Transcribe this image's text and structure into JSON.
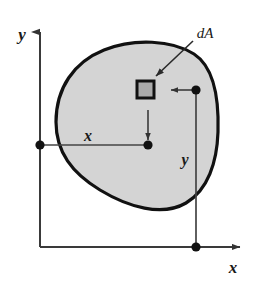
{
  "figure": {
    "type": "engineering-diagram",
    "background_color": "#ffffff"
  },
  "colors": {
    "outline": "#111111",
    "region_fill": "#d4d4d4",
    "element_fill": "#aaaaaa",
    "element_border": "#111111",
    "axis": "#444444",
    "dimension_line": "#444444",
    "marker": "#111111",
    "label": "#1a1a1a"
  },
  "axes": {
    "y_axis": {
      "label": "y",
      "orientation": "vertical",
      "arrow": "up",
      "x": 40,
      "y_top": 28,
      "y_bottom": 247,
      "label_x": 22,
      "label_y": 40
    },
    "x_axis": {
      "label": "x",
      "orientation": "horizontal",
      "arrow": "right",
      "y": 247,
      "x_left": 40,
      "x_right": 245,
      "label_x": 229,
      "label_y": 272
    }
  },
  "region": {
    "name": "plane-area",
    "fill": "#d4d4d4",
    "stroke_width": 3.2,
    "path": "M 56 122 C 56 88 74 62 104 50 C 134 38 172 40 194 54 C 214 67 219 100 218 132 C 217 162 208 190 186 203 C 162 217 128 207 100 190 C 72 173 56 152 56 122 Z"
  },
  "element": {
    "name": "dA",
    "label": "dA",
    "label_x": 196,
    "label_y": 38,
    "square": {
      "x": 136,
      "y": 80,
      "width": 18,
      "height": 18
    },
    "leader": {
      "x1": 193,
      "y1": 41,
      "x2": 154,
      "y2": 77
    }
  },
  "dimensions": [
    {
      "name": "x-dimension",
      "label": "x",
      "label_x": 82,
      "label_y": 142,
      "from": {
        "x": 40,
        "y": 145
      },
      "to": {
        "x": 148,
        "y": 145
      },
      "orientation": "horizontal"
    },
    {
      "name": "y-dimension",
      "label": "y",
      "label_x": 179,
      "label_y": 165,
      "from": {
        "x": 196,
        "y": 90
      },
      "to": {
        "x": 196,
        "y": 247
      },
      "orientation": "vertical"
    }
  ],
  "markers": [
    {
      "name": "y-axis-origin-marker",
      "x": 40,
      "y": 145,
      "r": 4.6
    },
    {
      "name": "centroid-marker",
      "x": 148,
      "y": 145,
      "r": 4.6
    },
    {
      "name": "element-center-marker",
      "x": 196,
      "y": 90,
      "r": 4.6
    },
    {
      "name": "x-axis-projection-marker",
      "x": 196,
      "y": 247,
      "r": 4.6
    }
  ],
  "connectors": [
    {
      "name": "centroid-drop-line",
      "x1": 148,
      "y1": 112,
      "x2": 148,
      "y2": 143,
      "arrow": "down"
    },
    {
      "name": "element-lead-line",
      "x1": 172,
      "y1": 90,
      "x2": 194,
      "y2": 90,
      "arrow": "left"
    }
  ]
}
